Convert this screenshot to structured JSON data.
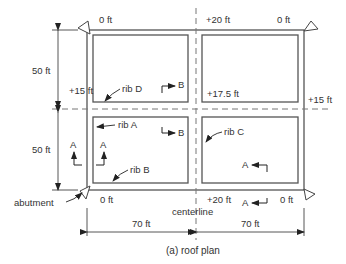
{
  "diagram": {
    "caption": "(a) roof plan",
    "elevations": {
      "top_left": "0 ft",
      "top_center": "+20 ft",
      "top_right": "0 ft",
      "left_mid": "+15 ft",
      "center_mid": "+17.5 ft",
      "right_mid": "+15 ft",
      "bottom_left": "0 ft",
      "bottom_center": "+20 ft",
      "bottom_right": "0 ft"
    },
    "dimensions": {
      "left_upper": "50 ft",
      "left_lower": "50 ft",
      "bottom_left": "70 ft",
      "bottom_right": "70 ft"
    },
    "ribs": {
      "a": "rib A",
      "b": "rib B",
      "c": "rib C",
      "d": "rib D"
    },
    "section_markers": {
      "a1": "A",
      "a2": "A",
      "a3": "A",
      "a4": "A",
      "b1": "B",
      "b2": "B"
    },
    "labels": {
      "abutment": "abutment",
      "centerline": "centerline"
    },
    "colors": {
      "line": "#555555",
      "text": "#333333"
    }
  }
}
